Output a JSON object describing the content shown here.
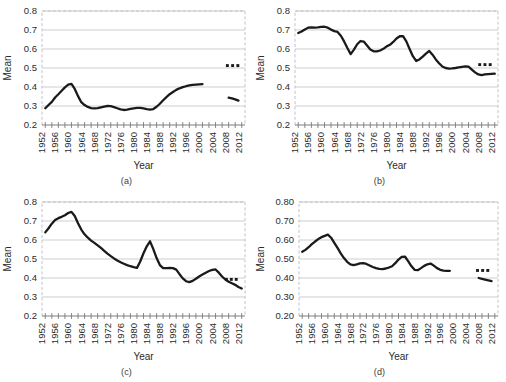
{
  "figure": {
    "width": 506,
    "height": 382,
    "background": "#ffffff",
    "line_color": "#1a1a1a",
    "grid_color": "#b9b9b9",
    "frame_color": "#b0b0c4"
  },
  "panels": [
    {
      "id": "a",
      "caption": "(a)",
      "chart_data": {
        "type": "line",
        "title": "",
        "xlabel": "Year",
        "ylabel": "Mean",
        "ylim": [
          0.2,
          0.8
        ],
        "ytick_labels": [
          "0.2",
          "0.3",
          "0.4",
          "0.5",
          "0.6",
          "0.7",
          "0.8"
        ],
        "ytick_values": [
          0.2,
          0.3,
          0.4,
          0.5,
          0.6,
          0.7,
          0.8
        ],
        "xlim": [
          1951,
          2013
        ],
        "xtick_labels": [
          "1952",
          "1956",
          "1960",
          "1964",
          "1968",
          "1972",
          "1976",
          "1980",
          "1984",
          "1988",
          "1992",
          "1996",
          "2000",
          "2004",
          "2008",
          "2012"
        ],
        "xtick_values": [
          1952,
          1956,
          1960,
          1964,
          1968,
          1972,
          1976,
          1980,
          1984,
          1988,
          1992,
          1996,
          2000,
          2004,
          2008,
          2012
        ],
        "minor_tick_step": 2,
        "grid": true,
        "legend": "none",
        "series": [
          {
            "name": "main",
            "x": [
              1952,
              1953,
              1954,
              1955,
              1956,
              1957,
              1958,
              1959,
              1960,
              1961,
              1962,
              1963,
              1964,
              1965,
              1966,
              1967,
              1968,
              1969,
              1970,
              1971,
              1972,
              1973,
              1974,
              1975,
              1976,
              1977,
              1978,
              1979,
              1980,
              1981,
              1982,
              1983,
              1984,
              1985,
              1986,
              1987,
              1988,
              1989,
              1990,
              1991,
              1992,
              1993,
              1994,
              1995,
              1996,
              1997,
              1998,
              1999,
              2000
            ],
            "values": [
              0.288,
              0.305,
              0.322,
              0.345,
              0.362,
              0.38,
              0.398,
              0.412,
              0.416,
              0.39,
              0.352,
              0.32,
              0.305,
              0.295,
              0.289,
              0.288,
              0.289,
              0.293,
              0.297,
              0.3,
              0.299,
              0.294,
              0.288,
              0.282,
              0.279,
              0.281,
              0.285,
              0.288,
              0.29,
              0.29,
              0.287,
              0.283,
              0.281,
              0.284,
              0.296,
              0.312,
              0.33,
              0.347,
              0.362,
              0.374,
              0.385,
              0.393,
              0.399,
              0.404,
              0.408,
              0.411,
              0.413,
              0.414,
              0.415
            ]
          },
          {
            "name": "forecast",
            "x": [
              2008,
              2009,
              2010,
              2011
            ],
            "values": [
              0.344,
              0.34,
              0.335,
              0.328
            ]
          }
        ],
        "annotations": {
          "dots": {
            "label": "three-dots",
            "x": [
              2007.6,
              2009.2,
              2010.8
            ],
            "y": 0.513,
            "count": 3
          }
        }
      }
    },
    {
      "id": "b",
      "caption": "(b)",
      "chart_data": {
        "type": "line",
        "title": "",
        "xlabel": "Year",
        "ylabel": "Mean",
        "ylim": [
          0.2,
          0.8
        ],
        "ytick_labels": [
          "0.2",
          "0.3",
          "0.4",
          "0.5",
          "0.6",
          "0.7",
          "0.8"
        ],
        "ytick_values": [
          0.2,
          0.3,
          0.4,
          0.5,
          0.6,
          0.7,
          0.8
        ],
        "xlim": [
          1951,
          2013
        ],
        "xtick_labels": [
          "1952",
          "1956",
          "1960",
          "1964",
          "1968",
          "1972",
          "1976",
          "1980",
          "1984",
          "1988",
          "1992",
          "1996",
          "2000",
          "2004",
          "2008",
          "2012"
        ],
        "xtick_values": [
          1952,
          1956,
          1960,
          1964,
          1968,
          1972,
          1976,
          1980,
          1984,
          1988,
          1992,
          1996,
          2000,
          2004,
          2008,
          2012
        ],
        "minor_tick_step": 2,
        "grid": true,
        "legend": "none",
        "series": [
          {
            "name": "main",
            "x": [
              1952,
              1953,
              1954,
              1955,
              1956,
              1957,
              1958,
              1959,
              1960,
              1961,
              1962,
              1963,
              1964,
              1965,
              1966,
              1967,
              1968,
              1969,
              1970,
              1971,
              1972,
              1973,
              1974,
              1975,
              1976,
              1977,
              1978,
              1979,
              1980,
              1981,
              1982,
              1983,
              1984,
              1985,
              1986,
              1987,
              1988,
              1989,
              1990,
              1991,
              1992,
              1993,
              1994,
              1995,
              1996,
              1997,
              1998,
              1999,
              2000,
              2001,
              2002,
              2003,
              2004,
              2005,
              2006,
              2007,
              2008,
              2009,
              2010,
              2011,
              2012
            ],
            "values": [
              0.684,
              0.692,
              0.703,
              0.712,
              0.714,
              0.713,
              0.714,
              0.716,
              0.717,
              0.712,
              0.702,
              0.694,
              0.69,
              0.67,
              0.64,
              0.605,
              0.573,
              0.597,
              0.625,
              0.642,
              0.639,
              0.618,
              0.597,
              0.588,
              0.587,
              0.592,
              0.601,
              0.614,
              0.622,
              0.637,
              0.655,
              0.667,
              0.668,
              0.64,
              0.6,
              0.562,
              0.537,
              0.545,
              0.56,
              0.576,
              0.59,
              0.57,
              0.545,
              0.525,
              0.508,
              0.5,
              0.497,
              0.498,
              0.5,
              0.503,
              0.506,
              0.508,
              0.507,
              0.492,
              0.477,
              0.466,
              0.462,
              0.466,
              0.468,
              0.469,
              0.47
            ]
          }
        ],
        "annotations": {
          "dots": {
            "label": "three-dots",
            "x": [
              2007.4,
              2009.0,
              2010.6
            ],
            "y": 0.518,
            "count": 3
          }
        }
      }
    },
    {
      "id": "c",
      "caption": "(c)",
      "chart_data": {
        "type": "line",
        "title": "",
        "xlabel": "Year",
        "ylabel": "Mean",
        "ylim": [
          0.2,
          0.8
        ],
        "ytick_labels": [
          "0.2",
          "0.3",
          "0.4",
          "0.5",
          "0.6",
          "0.7",
          "0.8"
        ],
        "ytick_values": [
          0.2,
          0.3,
          0.4,
          0.5,
          0.6,
          0.7,
          0.8
        ],
        "xlim": [
          1951,
          2013
        ],
        "xtick_labels": [
          "1952",
          "1956",
          "1960",
          "1964",
          "1968",
          "1972",
          "1976",
          "1980",
          "1984",
          "1988",
          "1992",
          "1996",
          "2000",
          "2004",
          "2008",
          "2012"
        ],
        "xtick_values": [
          1952,
          1956,
          1960,
          1964,
          1968,
          1972,
          1976,
          1980,
          1984,
          1988,
          1992,
          1996,
          2000,
          2004,
          2008,
          2012
        ],
        "minor_tick_step": 2,
        "grid": true,
        "legend": "none",
        "series": [
          {
            "name": "main",
            "x": [
              1952,
              1953,
              1954,
              1955,
              1956,
              1957,
              1958,
              1959,
              1960,
              1961,
              1962,
              1963,
              1964,
              1965,
              1966,
              1967,
              1968,
              1969,
              1970,
              1971,
              1972,
              1973,
              1974,
              1975,
              1976,
              1977,
              1978,
              1979,
              1980,
              1981,
              1982,
              1983,
              1984,
              1985,
              1986,
              1987,
              1988,
              1989,
              1990,
              1991,
              1992,
              1993,
              1994,
              1995,
              1996,
              1997,
              1998,
              1999,
              2000,
              2001,
              2002,
              2003,
              2004,
              2005,
              2006,
              2007,
              2008,
              2009,
              2010,
              2011,
              2012
            ],
            "values": [
              0.64,
              0.662,
              0.686,
              0.705,
              0.715,
              0.722,
              0.73,
              0.742,
              0.748,
              0.726,
              0.688,
              0.655,
              0.63,
              0.612,
              0.597,
              0.585,
              0.572,
              0.558,
              0.543,
              0.528,
              0.515,
              0.503,
              0.492,
              0.483,
              0.475,
              0.468,
              0.462,
              0.457,
              0.453,
              0.487,
              0.53,
              0.567,
              0.593,
              0.552,
              0.505,
              0.468,
              0.452,
              0.452,
              0.453,
              0.452,
              0.444,
              0.42,
              0.398,
              0.383,
              0.378,
              0.385,
              0.396,
              0.408,
              0.418,
              0.428,
              0.437,
              0.443,
              0.445,
              0.428,
              0.408,
              0.392,
              0.38,
              0.372,
              0.364,
              0.353,
              0.345
            ]
          }
        ],
        "annotations": {
          "dots": {
            "label": "three-dots",
            "x": [
              2007.3,
              2008.8,
              2010.3
            ],
            "y": 0.393,
            "count": 3
          }
        }
      }
    },
    {
      "id": "d",
      "caption": "(d)",
      "chart_data": {
        "type": "line",
        "title": "",
        "xlabel": "Year",
        "ylabel": "Mean",
        "ylim": [
          0.2,
          0.8
        ],
        "ytick_labels": [
          "0.20",
          "0.30",
          "0.40",
          "0.50",
          "0.60",
          "0.70",
          "0.80"
        ],
        "ytick_values": [
          0.2,
          0.3,
          0.4,
          0.5,
          0.6,
          0.7,
          0.8
        ],
        "xlim": [
          1951,
          2013
        ],
        "xtick_labels": [
          "1952",
          "1956",
          "1960",
          "1964",
          "1968",
          "1972",
          "1976",
          "1980",
          "1984",
          "1988",
          "1992",
          "1996",
          "2000",
          "2004",
          "2008",
          "2012"
        ],
        "xtick_values": [
          1952,
          1956,
          1960,
          1964,
          1968,
          1972,
          1976,
          1980,
          1984,
          1988,
          1992,
          1996,
          2000,
          2004,
          2008,
          2012
        ],
        "minor_tick_step": 2,
        "grid": true,
        "legend": "none",
        "series": [
          {
            "name": "main",
            "x": [
              1952,
              1953,
              1954,
              1955,
              1956,
              1957,
              1958,
              1959,
              1960,
              1961,
              1962,
              1963,
              1964,
              1965,
              1966,
              1967,
              1968,
              1969,
              1970,
              1971,
              1972,
              1973,
              1974,
              1975,
              1976,
              1977,
              1978,
              1979,
              1980,
              1981,
              1982,
              1983,
              1984,
              1985,
              1986,
              1987,
              1988,
              1989,
              1990,
              1991,
              1992,
              1993,
              1994,
              1995,
              1996,
              1997,
              1998
            ],
            "values": [
              0.538,
              0.548,
              0.562,
              0.578,
              0.592,
              0.605,
              0.615,
              0.622,
              0.628,
              0.612,
              0.585,
              0.558,
              0.53,
              0.505,
              0.485,
              0.472,
              0.468,
              0.472,
              0.477,
              0.478,
              0.474,
              0.466,
              0.458,
              0.452,
              0.448,
              0.447,
              0.45,
              0.455,
              0.462,
              0.478,
              0.497,
              0.511,
              0.513,
              0.489,
              0.463,
              0.443,
              0.441,
              0.452,
              0.464,
              0.472,
              0.476,
              0.465,
              0.452,
              0.443,
              0.439,
              0.438,
              0.438
            ]
          },
          {
            "name": "forecast",
            "x": [
              2007,
              2008,
              2009,
              2010,
              2011
            ],
            "values": [
              0.4,
              0.396,
              0.392,
              0.388,
              0.384
            ]
          }
        ],
        "annotations": {
          "dots": {
            "label": "three-dots",
            "x": [
              2006.6,
              2008.2,
              2009.8
            ],
            "y": 0.44,
            "count": 3
          }
        }
      }
    }
  ]
}
